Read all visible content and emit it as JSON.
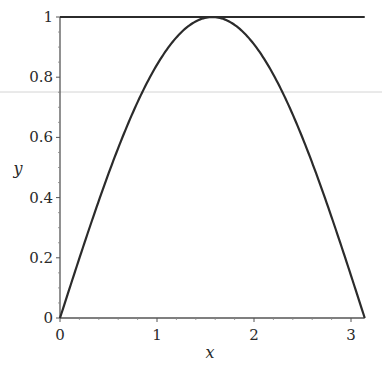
{
  "chart_data": {
    "type": "line",
    "title": "",
    "xlabel": "x",
    "ylabel": "y",
    "xlim": [
      0,
      3.1416
    ],
    "ylim": [
      0,
      1
    ],
    "grid": false,
    "x_ticks": [
      0,
      1,
      2,
      3
    ],
    "x_tick_labels": [
      "0",
      "1",
      "2",
      "3"
    ],
    "y_ticks": [
      0,
      0.2,
      0.4,
      0.6,
      0.8,
      1
    ],
    "y_tick_labels": [
      "0",
      "0.2",
      "0.4",
      "0.6",
      "0.8",
      "1"
    ],
    "series": [
      {
        "name": "sin(x)",
        "x": [
          0,
          0.3927,
          0.7854,
          1.1781,
          1.5708,
          1.9635,
          2.3562,
          2.7489,
          3.1416
        ],
        "values": [
          0,
          0.3827,
          0.7071,
          0.9239,
          1.0,
          0.9239,
          0.7071,
          0.3827,
          0
        ],
        "color": "#2b2b2b"
      },
      {
        "name": "y = 1",
        "x": [
          0,
          3.1416
        ],
        "values": [
          1,
          1
        ],
        "color": "#2b2b2b"
      }
    ]
  },
  "layout": {
    "origin_px": [
      60,
      318
    ],
    "x_px_per_unit": 97,
    "y_px_per_unit": 301
  },
  "colors": {
    "line": "#2b2b2b",
    "axis": "#555555",
    "artifact_line": "#cfcfcf"
  }
}
